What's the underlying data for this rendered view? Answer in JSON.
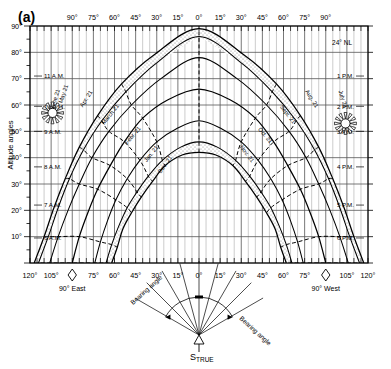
{
  "figure": {
    "panel_label": "(a)",
    "latitude_label": "24° NL",
    "y_axis_title": "Altitude angles",
    "bearing_label_left": "Bearing angle",
    "bearing_label_right": "Bearing angle",
    "south_marker": "S",
    "south_marker_sub": "TRUE",
    "east_marker": "90° East",
    "west_marker": "90° West",
    "sun_icon_left": "sun-icon",
    "sun_icon_right": "sun-icon",
    "colors": {
      "line": "#000000",
      "grid": "#3a3a3a",
      "stipple": "#d8d8d8",
      "background": "#ffffff"
    }
  },
  "chart_data": {
    "type": "line",
    "xlabel": "Bearing angle",
    "ylabel": "Altitude angles",
    "xlim": [
      -120,
      120
    ],
    "ylim": [
      0,
      90
    ],
    "grid": true,
    "legend": "inline-curve-labels",
    "x_axis_top_ticks": [
      "90°",
      "75°",
      "60°",
      "45°",
      "30°",
      "15°",
      "0°",
      "15°",
      "30°",
      "45°",
      "60°",
      "75°",
      "90°"
    ],
    "x_axis_top_values": [
      -90,
      -75,
      -60,
      -45,
      -30,
      -15,
      0,
      15,
      30,
      45,
      60,
      75,
      90
    ],
    "x_axis_bottom_ticks": [
      "120°",
      "105°",
      "90° East",
      "75°",
      "60°",
      "45°",
      "30°",
      "15°",
      "0°",
      "15°",
      "30°",
      "45°",
      "60°",
      "75°",
      "90° West",
      "105°",
      "120°"
    ],
    "x_axis_bottom_values": [
      -120,
      -105,
      -90,
      -75,
      -60,
      -45,
      -30,
      -15,
      0,
      15,
      30,
      45,
      60,
      75,
      90,
      105,
      120
    ],
    "y_axis_ticks": [
      "0°",
      "10°",
      "20°",
      "30°",
      "40°",
      "50°",
      "60°",
      "70°",
      "80°",
      "90°"
    ],
    "y_axis_values": [
      0,
      10,
      20,
      30,
      40,
      50,
      60,
      70,
      80,
      90
    ],
    "hour_labels_left": [
      "11 A.M.",
      "10 A.M.",
      "9 A.M.",
      "8 A.M.",
      "7 A.M.",
      "6 A.M."
    ],
    "hour_labels_right": [
      "1 P.M.",
      "2 P.M.",
      "3 P.M.",
      "4 P.M.",
      "5 P.M.",
      "6 P.M."
    ],
    "month_labels_left": [
      "June 21",
      "May 21",
      "Apr. 21",
      "March 21",
      "Febr. 21",
      "Jan. 21",
      "Dec. 21"
    ],
    "month_labels_right": [
      "July 21",
      "Aug. 21",
      "Sept. 21",
      "Oct. 21",
      "Nov. 21"
    ],
    "bearing_fan_ticks": [
      "60°",
      "45°",
      "30°",
      "15°",
      "0°",
      "15°",
      "30°",
      "45°",
      "60°"
    ],
    "series": [
      {
        "name": "June 21",
        "declination": 23.45,
        "max_altitude": 89,
        "points": [
          [
            -117,
            0
          ],
          [
            -110,
            10
          ],
          [
            -103,
            21
          ],
          [
            -95,
            32
          ],
          [
            -85,
            44
          ],
          [
            -72,
            56
          ],
          [
            -55,
            68
          ],
          [
            -32,
            79
          ],
          [
            0,
            89
          ],
          [
            32,
            79
          ],
          [
            55,
            68
          ],
          [
            72,
            56
          ],
          [
            85,
            44
          ],
          [
            95,
            32
          ],
          [
            103,
            21
          ],
          [
            110,
            10
          ],
          [
            117,
            0
          ]
        ]
      },
      {
        "name": "May 21 / July 21",
        "declination": 20.1,
        "max_altitude": 86,
        "points": [
          [
            -114,
            0
          ],
          [
            -107,
            10
          ],
          [
            -100,
            21
          ],
          [
            -92,
            32
          ],
          [
            -82,
            43
          ],
          [
            -69,
            54
          ],
          [
            -52,
            65
          ],
          [
            -30,
            76
          ],
          [
            0,
            86
          ],
          [
            30,
            76
          ],
          [
            52,
            65
          ],
          [
            69,
            54
          ],
          [
            82,
            43
          ],
          [
            92,
            32
          ],
          [
            100,
            21
          ],
          [
            107,
            10
          ],
          [
            114,
            0
          ]
        ]
      },
      {
        "name": "Apr. 21 / Aug. 21",
        "declination": 11.6,
        "max_altitude": 78,
        "points": [
          [
            -106,
            0
          ],
          [
            -100,
            10
          ],
          [
            -93,
            20
          ],
          [
            -85,
            30
          ],
          [
            -76,
            40
          ],
          [
            -64,
            50
          ],
          [
            -48,
            60
          ],
          [
            -27,
            70
          ],
          [
            0,
            78
          ],
          [
            27,
            70
          ],
          [
            48,
            60
          ],
          [
            64,
            50
          ],
          [
            76,
            40
          ],
          [
            85,
            30
          ],
          [
            93,
            20
          ],
          [
            100,
            10
          ],
          [
            106,
            0
          ]
        ]
      },
      {
        "name": "March 21 / Sept. 21",
        "declination": 0,
        "max_altitude": 66,
        "points": [
          [
            -90,
            0
          ],
          [
            -85,
            10
          ],
          [
            -79,
            19
          ],
          [
            -72,
            28
          ],
          [
            -63,
            37
          ],
          [
            -53,
            46
          ],
          [
            -40,
            55
          ],
          [
            -22,
            62
          ],
          [
            0,
            66
          ],
          [
            22,
            62
          ],
          [
            40,
            55
          ],
          [
            53,
            46
          ],
          [
            63,
            37
          ],
          [
            72,
            28
          ],
          [
            79,
            19
          ],
          [
            85,
            10
          ],
          [
            90,
            0
          ]
        ]
      },
      {
        "name": "Febr. 21 / Oct. 21",
        "declination": -11.6,
        "max_altitude": 54,
        "points": [
          [
            -74,
            0
          ],
          [
            -70,
            8
          ],
          [
            -65,
            16
          ],
          [
            -59,
            24
          ],
          [
            -51,
            32
          ],
          [
            -42,
            39
          ],
          [
            -30,
            46
          ],
          [
            -16,
            51
          ],
          [
            0,
            54
          ],
          [
            16,
            51
          ],
          [
            30,
            46
          ],
          [
            42,
            39
          ],
          [
            51,
            32
          ],
          [
            59,
            24
          ],
          [
            65,
            16
          ],
          [
            70,
            8
          ],
          [
            74,
            0
          ]
        ]
      },
      {
        "name": "Jan. 21 / Nov. 21",
        "declination": -20.1,
        "max_altitude": 46,
        "points": [
          [
            -66,
            0
          ],
          [
            -62,
            7
          ],
          [
            -57,
            14
          ],
          [
            -51,
            21
          ],
          [
            -44,
            27
          ],
          [
            -36,
            33
          ],
          [
            -26,
            39
          ],
          [
            -13,
            44
          ],
          [
            0,
            46
          ],
          [
            13,
            44
          ],
          [
            26,
            39
          ],
          [
            36,
            33
          ],
          [
            44,
            27
          ],
          [
            51,
            21
          ],
          [
            57,
            14
          ],
          [
            62,
            7
          ],
          [
            66,
            0
          ]
        ]
      },
      {
        "name": "Dec. 21",
        "declination": -23.45,
        "max_altitude": 42,
        "points": [
          [
            -62,
            0
          ],
          [
            -58,
            6
          ],
          [
            -54,
            13
          ],
          [
            -48,
            19
          ],
          [
            -41,
            25
          ],
          [
            -33,
            31
          ],
          [
            -24,
            37
          ],
          [
            -12,
            41
          ],
          [
            0,
            42
          ],
          [
            12,
            41
          ],
          [
            24,
            37
          ],
          [
            33,
            31
          ],
          [
            41,
            25
          ],
          [
            48,
            19
          ],
          [
            54,
            13
          ],
          [
            58,
            6
          ],
          [
            62,
            0
          ]
        ]
      }
    ],
    "hour_curves": [
      {
        "name": "6 A.M.",
        "x": [
          -117,
          -114,
          -106,
          -90,
          -74,
          -66,
          -62
        ],
        "y": [
          0,
          0,
          0,
          0,
          0,
          0,
          0
        ]
      },
      {
        "name": "7 A.M.",
        "x": [
          -110,
          -107,
          -100,
          -85,
          -70,
          -62,
          -58
        ],
        "y": [
          10,
          10,
          10,
          10,
          8,
          7,
          6
        ]
      },
      {
        "name": "8 A.M.",
        "x": [
          -95,
          -92,
          -85,
          -72,
          -59,
          -51,
          -48
        ],
        "y": [
          32,
          32,
          30,
          28,
          24,
          21,
          19
        ]
      },
      {
        "name": "9 A.M.",
        "x": [
          -85,
          -82,
          -76,
          -63,
          -51,
          -44,
          -41
        ],
        "y": [
          44,
          43,
          40,
          37,
          32,
          27,
          25
        ]
      },
      {
        "name": "10 A.M.",
        "x": [
          -72,
          -69,
          -64,
          -53,
          -42,
          -36,
          -33
        ],
        "y": [
          56,
          54,
          50,
          46,
          39,
          33,
          31
        ]
      },
      {
        "name": "11 A.M.",
        "x": [
          -55,
          -52,
          -48,
          -40,
          -30,
          -26,
          -24
        ],
        "y": [
          68,
          65,
          60,
          55,
          46,
          39,
          37
        ]
      },
      {
        "name": "Noon",
        "x": [
          0,
          0,
          0,
          0,
          0,
          0,
          0
        ],
        "y": [
          89,
          86,
          78,
          66,
          54,
          46,
          42
        ]
      },
      {
        "name": "1 P.M.",
        "x": [
          55,
          52,
          48,
          40,
          30,
          26,
          24
        ],
        "y": [
          68,
          65,
          60,
          55,
          46,
          39,
          37
        ]
      },
      {
        "name": "2 P.M.",
        "x": [
          72,
          69,
          64,
          53,
          42,
          36,
          33
        ],
        "y": [
          56,
          54,
          50,
          46,
          39,
          33,
          31
        ]
      },
      {
        "name": "3 P.M.",
        "x": [
          85,
          82,
          76,
          63,
          51,
          44,
          41
        ],
        "y": [
          44,
          43,
          40,
          37,
          32,
          27,
          25
        ]
      },
      {
        "name": "4 P.M.",
        "x": [
          95,
          92,
          85,
          72,
          59,
          51,
          48
        ],
        "y": [
          32,
          32,
          30,
          28,
          24,
          21,
          19
        ]
      },
      {
        "name": "5 P.M.",
        "x": [
          110,
          107,
          100,
          85,
          70,
          62,
          58
        ],
        "y": [
          10,
          10,
          10,
          10,
          8,
          7,
          6
        ]
      },
      {
        "name": "6 P.M.",
        "x": [
          117,
          114,
          106,
          90,
          74,
          66,
          62
        ],
        "y": [
          0,
          0,
          0,
          0,
          0,
          0,
          0
        ]
      }
    ]
  }
}
